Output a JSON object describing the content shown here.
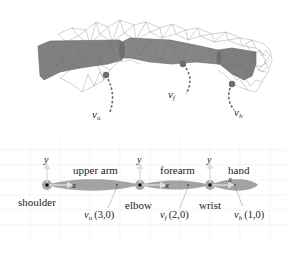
{
  "figure": {
    "top_panel": {
      "description": "3D arm mesh with wireframe and segment surface",
      "markers": [
        {
          "id": "vu",
          "label_main": "v",
          "label_sub": "u"
        },
        {
          "id": "vf",
          "label_main": "v",
          "label_sub": "f"
        },
        {
          "id": "vh",
          "label_main": "v",
          "label_sub": "h"
        }
      ]
    },
    "bottom_panel": {
      "segments": [
        {
          "name": "upper arm"
        },
        {
          "name": "forearm"
        },
        {
          "name": "hand"
        }
      ],
      "joints": [
        {
          "name": "shoulder"
        },
        {
          "name": "elbow"
        },
        {
          "name": "wrist"
        }
      ],
      "axis_x": "x",
      "axis_y": "y",
      "points": [
        {
          "label_main": "v",
          "label_sub": "u",
          "coords": "(3,0)"
        },
        {
          "label_main": "v",
          "label_sub": "f",
          "coords": "(2,0)"
        },
        {
          "label_main": "v",
          "label_sub": "h",
          "coords": "(1,0)"
        }
      ]
    },
    "colors": {
      "segment_fill": "#9a9a9a",
      "mesh_fill": "#7a7a7a",
      "wire": "#8c8c8c",
      "axis_arrow": "#c8a8a8",
      "grid": "#e8e8e8",
      "marker": "#6e6e6e"
    }
  }
}
